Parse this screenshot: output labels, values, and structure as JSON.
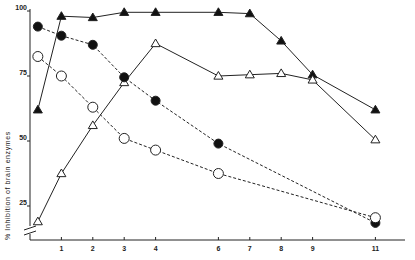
{
  "chart_data": {
    "type": "line",
    "title": "",
    "xlabel": "",
    "ylabel": "% Inhibition of brain enzymes",
    "x_ticks": [
      1,
      2,
      3,
      4,
      6,
      7,
      8,
      9,
      11
    ],
    "y_ticks": [
      25,
      50,
      75,
      100
    ],
    "xlim": [
      0,
      12
    ],
    "ylim": [
      15,
      100
    ],
    "y_axis_break": true,
    "grid": false,
    "legend": null,
    "x": [
      0.25,
      1,
      2,
      3,
      4,
      6,
      7,
      8,
      9,
      11
    ],
    "series": [
      {
        "name": "filled-triangle",
        "marker": "filled-triangle",
        "line": "solid",
        "x": [
          0.25,
          1,
          2,
          3,
          4,
          6,
          7,
          8,
          9,
          11
        ],
        "values": [
          62,
          98,
          97.5,
          99.5,
          99.5,
          99.5,
          99,
          88.5,
          75.5,
          62
        ]
      },
      {
        "name": "open-triangle",
        "marker": "open-triangle",
        "line": "solid",
        "x": [
          0.25,
          1,
          2,
          3,
          4,
          6,
          7,
          8,
          9,
          11
        ],
        "values": [
          19,
          37.5,
          56,
          72.5,
          87.5,
          75,
          75.5,
          76,
          73.5,
          50.5
        ]
      },
      {
        "name": "filled-circle",
        "marker": "filled-circle",
        "line": "dashed",
        "x": [
          0.25,
          1,
          2,
          3,
          4,
          6,
          11
        ],
        "values": [
          94,
          90.5,
          87,
          74.5,
          65.5,
          49,
          18.5
        ]
      },
      {
        "name": "open-circle",
        "marker": "open-circle",
        "line": "dashed",
        "x": [
          0.25,
          1,
          2,
          3,
          4,
          6,
          11
        ],
        "values": [
          82.5,
          75,
          63,
          51,
          46.5,
          37.5,
          20.5
        ]
      }
    ],
    "annotations": []
  }
}
